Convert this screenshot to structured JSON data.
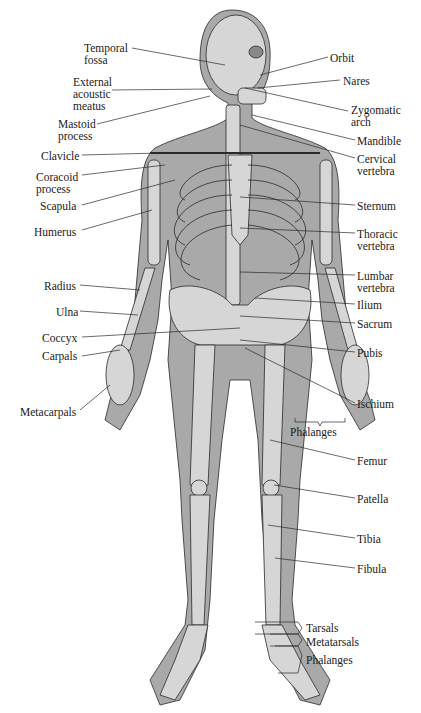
{
  "diagram": {
    "type": "anatomical-skeleton",
    "colors": {
      "body": "#a9a9a9",
      "bone": "#d6d6d6",
      "outline": "#2a2a2a",
      "leader": "#2a2a2a"
    }
  },
  "labels_left": [
    {
      "id": "temporal-fossa",
      "text": "Temporal\nfossa",
      "x": 84,
      "y": 42
    },
    {
      "id": "external-acoustic-meatus",
      "text": "External\nacoustic\nmeatus",
      "x": 73,
      "y": 76
    },
    {
      "id": "mastoid-process",
      "text": "Mastoid\nprocess",
      "x": 58,
      "y": 118
    },
    {
      "id": "clavicle",
      "text": "Clavicle",
      "x": 41,
      "y": 151
    },
    {
      "id": "coracoid-process",
      "text": "Coracoid\nprocess",
      "x": 36,
      "y": 171
    },
    {
      "id": "scapula",
      "text": "Scapula",
      "x": 40,
      "y": 200
    },
    {
      "id": "humerus",
      "text": "Humerus",
      "x": 34,
      "y": 226
    },
    {
      "id": "radius",
      "text": "Radius",
      "x": 44,
      "y": 280
    },
    {
      "id": "ulna",
      "text": "Ulna",
      "x": 56,
      "y": 306
    },
    {
      "id": "coccyx",
      "text": "Coccyx",
      "x": 42,
      "y": 332
    },
    {
      "id": "carpals",
      "text": "Carpals",
      "x": 42,
      "y": 350
    },
    {
      "id": "metacarpals",
      "text": "Metacarpals",
      "x": 20,
      "y": 406
    }
  ],
  "labels_right": [
    {
      "id": "orbit",
      "text": "Orbit",
      "x": 330,
      "y": 52
    },
    {
      "id": "nares",
      "text": "Nares",
      "x": 343,
      "y": 75
    },
    {
      "id": "zygomatic-arch",
      "text": "Zygomatic\narch",
      "x": 351,
      "y": 104
    },
    {
      "id": "mandible",
      "text": "Mandible",
      "x": 357,
      "y": 136
    },
    {
      "id": "cervical-vertebra",
      "text": "Cervical\nvertebra",
      "x": 357,
      "y": 153
    },
    {
      "id": "sternum",
      "text": "Sternum",
      "x": 357,
      "y": 200
    },
    {
      "id": "thoracic-vertebra",
      "text": "Thoracic\nvertebra",
      "x": 357,
      "y": 228
    },
    {
      "id": "lumbar-vertebra",
      "text": "Lumbar\nvertebra",
      "x": 357,
      "y": 270
    },
    {
      "id": "ilium",
      "text": "Ilium",
      "x": 357,
      "y": 299
    },
    {
      "id": "sacrum",
      "text": "Sacrum",
      "x": 357,
      "y": 318
    },
    {
      "id": "pubis",
      "text": "Pubis",
      "x": 357,
      "y": 347
    },
    {
      "id": "ischium",
      "text": "Ischium",
      "x": 357,
      "y": 398
    },
    {
      "id": "phalanges-hand",
      "text": "Phalanges",
      "x": 290,
      "y": 426
    },
    {
      "id": "femur",
      "text": "Femur",
      "x": 357,
      "y": 455
    },
    {
      "id": "patella",
      "text": "Patella",
      "x": 357,
      "y": 493
    },
    {
      "id": "tibia",
      "text": "Tibia",
      "x": 357,
      "y": 533
    },
    {
      "id": "fibula",
      "text": "Fibula",
      "x": 357,
      "y": 563
    },
    {
      "id": "tarsals",
      "text": "Tarsals",
      "x": 306,
      "y": 624
    },
    {
      "id": "metatarsals",
      "text": "Metatarsals",
      "x": 306,
      "y": 637
    },
    {
      "id": "phalanges-foot",
      "text": "Phalanges",
      "x": 306,
      "y": 654
    }
  ]
}
